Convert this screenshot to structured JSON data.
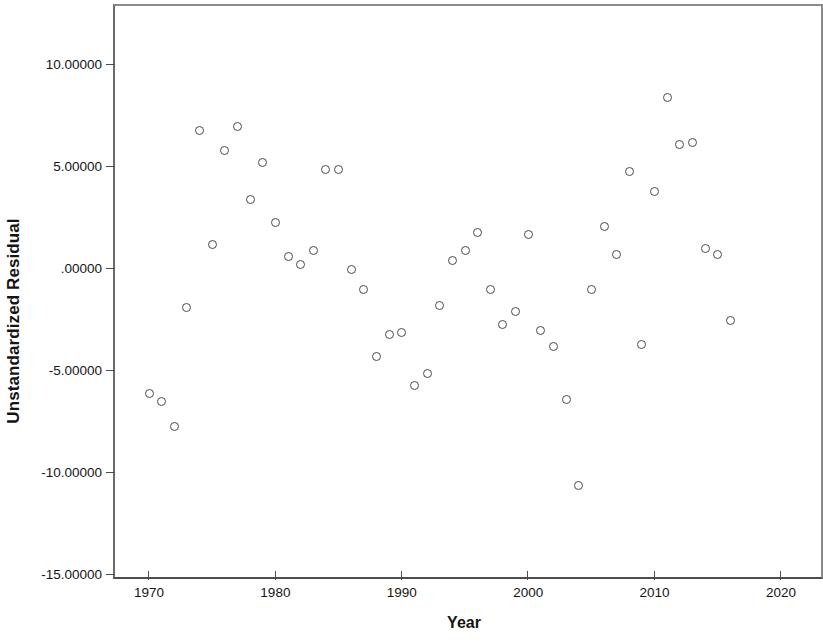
{
  "chart_data": {
    "type": "scatter",
    "title": "",
    "xlabel": "Year",
    "ylabel": "Unstandardized Residual",
    "xlim": [
      1967.0,
      2023.0
    ],
    "ylim": [
      -15.0,
      12.9
    ],
    "grid": false,
    "legend": "none",
    "marker": "open-circle",
    "xticks": [
      1970,
      1980,
      1990,
      2000,
      2010,
      2020
    ],
    "xtick_labels": [
      "1970",
      "1980",
      "1990",
      "2000",
      "2010",
      "2020"
    ],
    "yticks": [
      10.0,
      5.0,
      0.0,
      -5.0,
      -10.0,
      -15.0
    ],
    "ytick_labels": [
      "10.00000",
      "5.00000",
      ".00000",
      "-5.00000",
      "-10.00000",
      "-15.00000"
    ],
    "x": [
      1970,
      1971,
      1972,
      1973,
      1974,
      1975,
      1976,
      1977,
      1978,
      1979,
      1980,
      1981,
      1982,
      1983,
      1984,
      1985,
      1986,
      1987,
      1988,
      1989,
      1990,
      1991,
      1992,
      1993,
      1994,
      1995,
      1996,
      1997,
      1998,
      1999,
      2000,
      2001,
      2002,
      2003,
      2004,
      2005,
      2006,
      2007,
      2008,
      2009,
      2010,
      2011,
      2012,
      2013,
      2014,
      2015,
      2016
    ],
    "y": [
      -6.1,
      -6.5,
      -7.7,
      -1.9,
      6.8,
      1.2,
      5.8,
      7.0,
      3.4,
      5.2,
      2.3,
      0.6,
      0.2,
      0.9,
      4.9,
      4.9,
      0.0,
      -1.0,
      -4.3,
      -3.2,
      -3.1,
      -5.7,
      -5.1,
      -1.8,
      0.4,
      0.9,
      1.8,
      -1.0,
      -2.7,
      -2.1,
      1.7,
      -3.0,
      -3.8,
      -6.4,
      -10.6,
      -1.0,
      2.1,
      0.7,
      4.8,
      -3.7,
      3.8,
      8.4,
      6.1,
      6.2,
      1.0,
      0.7,
      -2.5
    ],
    "marker_color": "#4a4a4a",
    "frame_color": "#4d4d4d",
    "background": "#ffffff",
    "n_points": 47
  }
}
